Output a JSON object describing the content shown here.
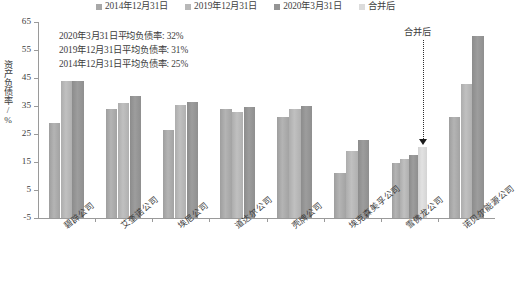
{
  "chart_data": {
    "type": "bar",
    "title": "",
    "xlabel": "",
    "ylabel": "资产负债率/%",
    "ylim": [
      -5,
      65
    ],
    "yticks": [
      -5,
      5,
      15,
      25,
      35,
      45,
      55,
      65
    ],
    "grid": false,
    "legend_position": "top",
    "categories": [
      "碧辟公司",
      "艾奎诺公司",
      "埃尼公司",
      "道达尔公司",
      "壳牌公司",
      "埃克森美孚公司",
      "雪佛龙公司",
      "诺贝尔能源公司"
    ],
    "series": [
      {
        "name": "2014年12月31日",
        "color": "#a8a8a8",
        "values": [
          29.0,
          34.0,
          26.5,
          34.0,
          31.0,
          11.0,
          14.5,
          31.0
        ]
      },
      {
        "name": "2019年12月31日",
        "color": "#b8b8b8",
        "values": [
          44.0,
          36.0,
          35.5,
          33.0,
          34.0,
          19.0,
          16.0,
          43.0
        ]
      },
      {
        "name": "2020年3月31日",
        "color": "#949494",
        "values": [
          44.0,
          38.5,
          36.5,
          34.5,
          35.0,
          23.0,
          17.5,
          60.0
        ]
      },
      {
        "name": "合并后",
        "color": "#dcdcdc",
        "values": [
          null,
          null,
          null,
          null,
          null,
          null,
          20.5,
          null
        ]
      }
    ],
    "annotations": [
      "2020年3月31日平均负债率: 32%",
      "2019年12月31日平均负债率: 31%",
      "2014年12月31日平均负债率: 25%"
    ],
    "callout": {
      "label": "合并后",
      "target_category": "雪佛龙公司",
      "target_series": "合并后",
      "target_value": 20.5
    }
  },
  "legend": {
    "items": [
      {
        "label": "2014年12月31日",
        "color": "#a8a8a8"
      },
      {
        "label": "2019年12月31日",
        "color": "#b8b8b8"
      },
      {
        "label": "2020年3月31日",
        "color": "#949494"
      },
      {
        "label": "合并后",
        "color": "#dcdcdc"
      }
    ]
  }
}
